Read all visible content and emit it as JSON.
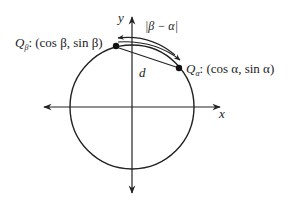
{
  "diagram": {
    "axes": {
      "x_label": "x",
      "y_label": "y"
    },
    "point_beta": {
      "name": "Q",
      "subscript": "β",
      "coords": ": (cos β, sin β)"
    },
    "point_alpha": {
      "name": "Q",
      "subscript": "α",
      "coords": ": (cos α, sin α)"
    },
    "arc_label": "|β − α|",
    "chord_label": "d",
    "colors": {
      "stroke": "#222222",
      "background": "#ffffff"
    }
  }
}
